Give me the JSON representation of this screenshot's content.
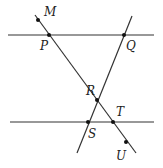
{
  "diagram": {
    "title": "",
    "colors": {
      "line": "#333333",
      "point": "#111111",
      "label": "#222222"
    },
    "lines": [
      {
        "id": "top-parallel",
        "x1": 8,
        "y1": 35,
        "x2": 154,
        "y2": 35
      },
      {
        "id": "bottom-parallel",
        "x1": 10,
        "y1": 122,
        "x2": 154,
        "y2": 122
      },
      {
        "id": "transversal-MU",
        "x1": 35,
        "y1": 15,
        "x2": 136,
        "y2": 153
      },
      {
        "id": "transversal-QS",
        "x1": 132,
        "y1": 16,
        "x2": 77,
        "y2": 153
      }
    ],
    "points": [
      {
        "name": "M",
        "x": 38,
        "y": 20,
        "lx": 44,
        "ly": 16
      },
      {
        "name": "P",
        "x": 49,
        "y": 35,
        "lx": 40,
        "ly": 50
      },
      {
        "name": "Q",
        "x": 124,
        "y": 35,
        "lx": 126,
        "ly": 50
      },
      {
        "name": "R",
        "x": 97,
        "y": 100,
        "lx": 86,
        "ly": 95
      },
      {
        "name": "S",
        "x": 88,
        "y": 122,
        "lx": 88,
        "ly": 138
      },
      {
        "name": "T",
        "x": 113,
        "y": 122,
        "lx": 116,
        "ly": 116
      },
      {
        "name": "U",
        "x": 126,
        "y": 142,
        "lx": 116,
        "ly": 160
      }
    ]
  }
}
